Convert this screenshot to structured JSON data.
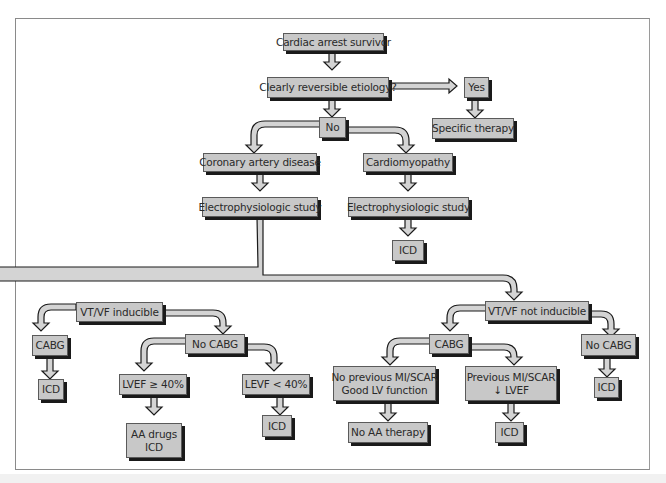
{
  "diagram": {
    "title_nodes": {
      "root": "Cardiac arrest survivor",
      "reversible": "Clearly reversible etiology?",
      "yes": "Yes",
      "specific_therapy": "Specific therapy",
      "no": "No",
      "cad": "Coronary artery disease",
      "cardiomyopathy": "Cardiomyopathy",
      "eps_cad": "Electrophysiologic study",
      "eps_cm": "Electrophysiologic study",
      "icd_cm": "ICD",
      "inducible": "VT/VF inducible",
      "not_inducible": "VT/VF not inducible",
      "cabg_ind": "CABG",
      "icd_cabg_ind": "ICD",
      "nocabg_ind": "No CABG",
      "lvef_ge": "LVEF ≥ 40%",
      "lvef_lt": "LEVF < 40%",
      "aa_drugs_l1": "AA drugs",
      "aa_drugs_l2": "ICD",
      "icd_lvef_lt": "ICD",
      "cabg_notind": "CABG",
      "nocabg_notind": "No CABG",
      "icd_nocabg_notind": "ICD",
      "noprev_l1": "No previous MI/SCAR",
      "noprev_l2": "Good LV function",
      "prev_l1": "Previous MI/SCAR",
      "prev_l2": "↓ LVEF",
      "no_aa": "No AA therapy",
      "icd_prev": "ICD"
    },
    "colors": {
      "box_fill": "#c8c8c8",
      "box_shadow": "#1a1a1a",
      "arrow_fill": "#d4d4d4",
      "arrow_stroke": "#1a1a1a",
      "frame": "#8a8a8a"
    }
  }
}
